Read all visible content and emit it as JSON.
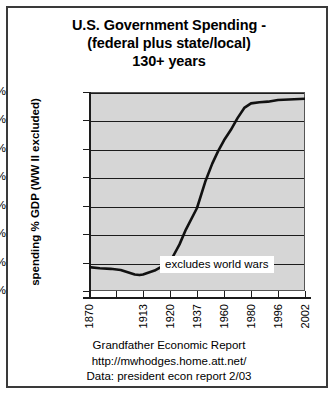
{
  "chart_data": {
    "type": "line",
    "title": "U.S. Government Spending - (federal plus state/local) 130+ years",
    "title_lines": [
      "U.S. Government Spending -",
      "(federal plus state/local)",
      "130+ years"
    ],
    "xlabel": "",
    "ylabel": "spending % GDP (WW II excluded)",
    "ylim": [
      0,
      35
    ],
    "yticks": [
      0,
      5,
      10,
      15,
      20,
      25,
      30,
      35
    ],
    "ytick_labels": [
      "0%",
      "5%",
      "10%",
      "15%",
      "20%",
      "25%",
      "30%",
      "35%"
    ],
    "xlim": [
      1870,
      2002
    ],
    "xtick_labels": [
      "1870",
      "",
      "1913",
      "1920",
      "1937",
      "1960",
      "1980",
      "1996",
      "2002"
    ],
    "xtick_years": [
      1870,
      1890,
      1913,
      1920,
      1937,
      1960,
      1980,
      1996,
      2002
    ],
    "grid": true,
    "legend": "none",
    "plot_background": "#d6d6d6",
    "line_color": "#111111",
    "annotations": [
      {
        "text": "excludes world wars",
        "x": 1945,
        "y": 6
      }
    ],
    "series": [
      {
        "name": "U.S. government spending as % of GDP",
        "x": [
          1870,
          1878,
          1886,
          1894,
          1900,
          1906,
          1910,
          1913,
          1916,
          1920,
          1926,
          1930,
          1937,
          1944,
          1950,
          1955,
          1960,
          1965,
          1970,
          1975,
          1980,
          1985,
          1990,
          1996,
          2002
        ],
        "values": [
          4.2,
          4.0,
          3.9,
          3.7,
          3.3,
          2.9,
          2.8,
          2.9,
          3.6,
          5.1,
          8.2,
          10.8,
          14.6,
          19.2,
          22.4,
          24.6,
          26.5,
          28.3,
          30.4,
          32.2,
          33.0,
          33.2,
          33.3,
          33.6,
          33.8
        ]
      }
    ]
  },
  "footer": {
    "lines": [
      "Grandfather Economic Report",
      "http://mwhodges.home.att.net/",
      "Data: president econ report 2/03"
    ]
  }
}
